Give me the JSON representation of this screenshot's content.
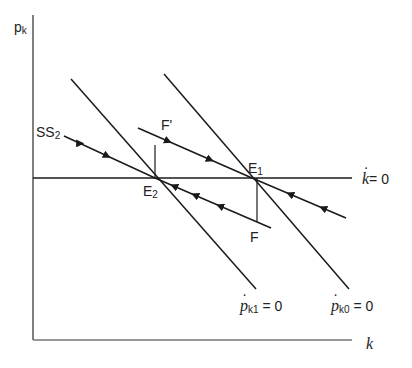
{
  "diagram": {
    "type": "phase diagram",
    "axes": {
      "y_label": "p",
      "y_label_sub": "k",
      "x_label": "k"
    },
    "curves": {
      "k_dot_zero": {
        "symbol": "k",
        "eq": "= 0"
      },
      "pk1_dot_zero": {
        "symbol": "p",
        "sub": "k1",
        "eq": "= 0"
      },
      "pk0_dot_zero": {
        "symbol": "p",
        "sub": "k0",
        "eq": "= 0"
      },
      "ss2": {
        "label": "SS",
        "sub": "2"
      }
    },
    "points": {
      "E1": {
        "label": "E",
        "sub": "1"
      },
      "E2": {
        "label": "E",
        "sub": "2"
      },
      "F": {
        "label": "F"
      },
      "F_prime": {
        "label": "F'"
      }
    },
    "colors": {
      "line": "#1a1a1a",
      "axis": "#555555"
    }
  }
}
